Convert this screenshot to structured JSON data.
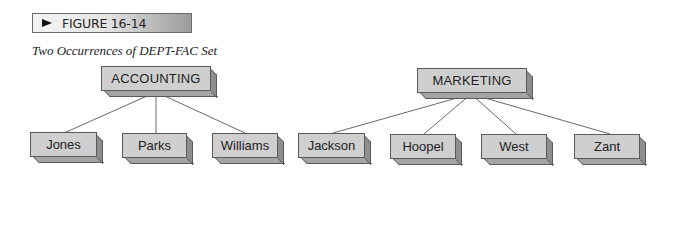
{
  "figure": {
    "label": "FIGURE 16-14",
    "arrow_icon": "right-arrowhead",
    "caption": "Two Occurrences of DEPT-FAC Set"
  },
  "colors": {
    "node_face": "#cfcfcf",
    "node_side": "#8e8e8e",
    "node_border": "#5a5a5a",
    "line": "#6a6a6a",
    "banner_light": "#f4f4f4",
    "banner_dark": "#9c9c9c"
  },
  "diagram": {
    "set_name": "DEPT-FAC",
    "occurrences": [
      {
        "owner": "ACCOUNTING",
        "members": [
          "Jones",
          "Parks",
          "Williams"
        ]
      },
      {
        "owner": "MARKETING",
        "members": [
          "Jackson",
          "Hoopel",
          "West",
          "Zant"
        ]
      }
    ]
  }
}
